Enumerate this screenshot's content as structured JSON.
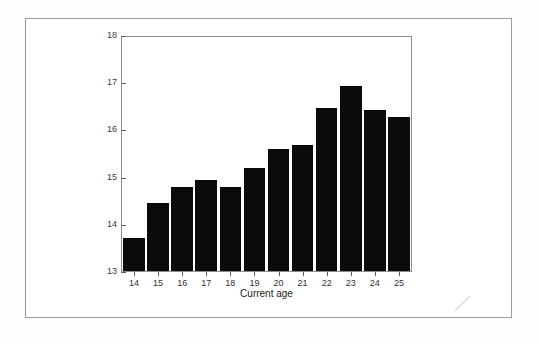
{
  "figure": {
    "background_color": "#ffffff",
    "frame_color": "#9a9a9a",
    "bar_color": "#0b0b0b",
    "axis_color": "#5f5f5f"
  },
  "chart_data": {
    "type": "bar",
    "title": "",
    "xlabel": "Current age",
    "ylabel": "Mean age plan started",
    "categories": [
      "14",
      "15",
      "16",
      "17",
      "18",
      "19",
      "20",
      "21",
      "22",
      "23",
      "24",
      "25"
    ],
    "values": [
      13.7,
      14.45,
      14.8,
      14.95,
      14.8,
      15.2,
      15.6,
      15.7,
      16.48,
      16.95,
      16.45,
      16.3
    ],
    "ylim": [
      13,
      18
    ],
    "yticks": [
      "13",
      "14",
      "15",
      "16",
      "17",
      "18"
    ],
    "ytick_values": [
      13,
      14,
      15,
      16,
      17,
      18
    ],
    "xticks": [
      "14",
      "15",
      "16",
      "17",
      "18",
      "19",
      "20",
      "21",
      "22",
      "23",
      "24",
      "25"
    ],
    "grid": false,
    "legend": null,
    "legend_position": "none"
  }
}
